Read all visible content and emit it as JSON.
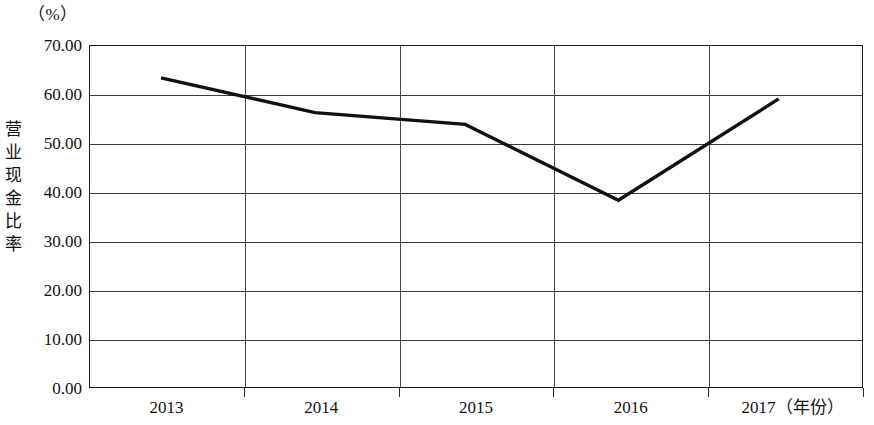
{
  "chart_data": {
    "type": "line",
    "title": "",
    "subtitle": "",
    "unit_label": "（%）",
    "ylabel": "营业现金比率",
    "xlabel": "（年份）",
    "categories": [
      "2013",
      "2014",
      "2015",
      "2016",
      "2017"
    ],
    "series": [
      {
        "name": "营业现金比率",
        "values": [
          63.3,
          56.2,
          53.8,
          38.3,
          59.0
        ]
      }
    ],
    "ylim": [
      0,
      70
    ],
    "ytick_labels": [
      "70.00",
      "60.00",
      "50.00",
      "40.00",
      "30.00",
      "20.00",
      "10.00",
      "0.00"
    ],
    "ytick_values": [
      70,
      60,
      50,
      40,
      30,
      20,
      10,
      0
    ],
    "grid": true,
    "grid_axis": "y",
    "legend": "none",
    "line_color": "#111111",
    "frame_color": "#1a1a1a",
    "grid_color": "#3a3a3a",
    "markers": false
  },
  "axis_title_chars": [
    "营",
    "业",
    "现",
    "金",
    "比",
    "率"
  ],
  "xlabels": [
    {
      "text": "2013",
      "unit": ""
    },
    {
      "text": "2014",
      "unit": ""
    },
    {
      "text": "2015",
      "unit": ""
    },
    {
      "text": "2016",
      "unit": ""
    },
    {
      "text": "2017",
      "unit": "（年份）"
    }
  ]
}
